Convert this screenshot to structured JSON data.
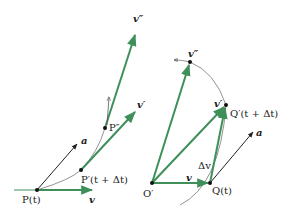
{
  "colors": {
    "green": "#3f8f5a",
    "black": "#222222",
    "curve": "#777777"
  },
  "left": {
    "point_P": "P(t)",
    "point_P_prime": "P′(t + Δt)",
    "point_P_double": "P″",
    "vec_v": "v",
    "vec_a": "a",
    "vec_v_prime": "v′",
    "vec_v_double": "v″"
  },
  "right": {
    "origin": "O′",
    "point_Q": "Q(t)",
    "point_Q_prime": "Q′(t + Δt)",
    "vec_v": "v",
    "vec_v_prime": "v′",
    "vec_v_double": "v″",
    "vec_delta_v": "Δv",
    "vec_a": "a"
  }
}
